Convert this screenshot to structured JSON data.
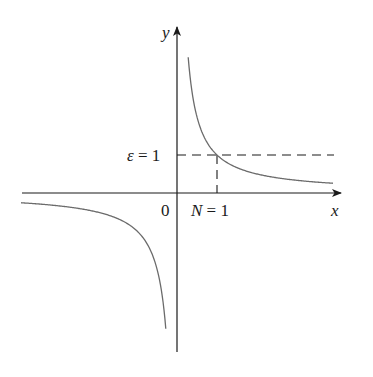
{
  "diagram": {
    "function": "y = 1/x",
    "labels": {
      "y_axis": "y",
      "x_axis": "x",
      "origin": "0",
      "epsilon": "ε = 1",
      "N": "N = 1"
    },
    "colors": {
      "axis": "#1a1a1a",
      "curve": "#6b6b6b",
      "dashed": "#1a1a1a"
    }
  },
  "chart_data": {
    "type": "line",
    "title": "",
    "xlabel": "x",
    "ylabel": "y",
    "series": [
      {
        "name": "y = 1/x (x > 0)",
        "x_range": [
          0.28,
          3.9
        ],
        "formula": "1/x"
      },
      {
        "name": "y = 1/x (x < 0)",
        "x_range": [
          -3.9,
          -0.28
        ],
        "formula": "1/x"
      }
    ],
    "annotations": [
      {
        "type": "hline",
        "y": 1,
        "style": "dashed",
        "label": "ε = 1"
      },
      {
        "type": "vline",
        "x": 1,
        "y_range": [
          0,
          1
        ],
        "style": "dashed",
        "label": "N = 1"
      }
    ],
    "xlim": [
      -4,
      4
    ],
    "ylim": [
      -4,
      4
    ],
    "grid": false
  }
}
